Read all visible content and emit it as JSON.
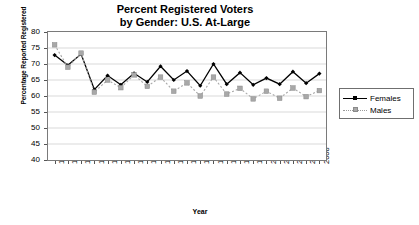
{
  "chart_data": {
    "type": "line",
    "title": "Percent Registered Voters by Gender: U.S. At-Large",
    "title_line1": "Percent Registered Voters",
    "title_line2": "by Gender: U.S. At-Large",
    "xlabel": "Year",
    "ylabel": "Percentage Reported Registered",
    "ylim": [
      40,
      80
    ],
    "yticks": [
      80,
      75,
      70,
      65,
      60,
      55,
      50,
      45,
      40
    ],
    "grid": true,
    "grid_axis": "y",
    "legend_position": "right",
    "categories": [
      1968,
      1970,
      1972,
      1974,
      1976,
      1978,
      1980,
      1982,
      1984,
      1986,
      1988,
      1990,
      1992,
      1994,
      1996,
      1998,
      2000,
      2002,
      2004,
      2006,
      2008
    ],
    "xtick_labels": [
      "1968",
      "1970",
      "1972",
      "1974",
      "1976",
      "1978",
      "1980",
      "1982",
      "1984",
      "1986",
      "1988",
      "1990",
      "1992",
      "1994",
      "1996",
      "1998",
      "2000",
      "2002",
      "2004",
      "2006",
      "2008"
    ],
    "series": [
      {
        "name": "Females",
        "color": "#000000",
        "line_style": "solid",
        "marker": "diamond",
        "values": [
          72.8,
          69.6,
          73.1,
          62.0,
          66.4,
          63.5,
          67.1,
          64.4,
          69.3,
          65.0,
          67.8,
          63.2,
          70.0,
          63.7,
          67.3,
          63.5,
          65.6,
          63.7,
          67.6,
          64.0,
          67.0
        ]
      },
      {
        "name": "Males",
        "color": "#a8a8a8",
        "line_style": "dotted",
        "marker": "square",
        "values": [
          76.0,
          69.0,
          73.4,
          61.2,
          65.0,
          62.6,
          66.6,
          63.0,
          65.9,
          61.5,
          64.1,
          60.0,
          65.9,
          60.6,
          62.4,
          59.1,
          61.5,
          59.3,
          62.5,
          59.8,
          61.7
        ]
      }
    ]
  },
  "legend": {
    "items": [
      {
        "label": "Females"
      },
      {
        "label": "Males"
      }
    ]
  }
}
